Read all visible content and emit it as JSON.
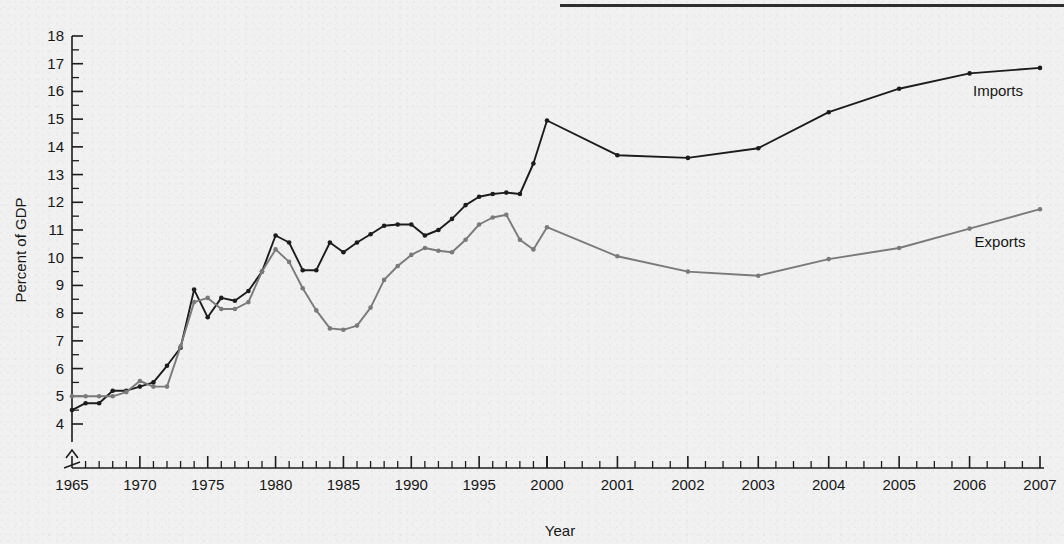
{
  "figure": {
    "background_color": "#f1f1f1",
    "rule_color": "#2e2e2e"
  },
  "axes": {
    "xlabel": "Year",
    "ylabel": "Percent of GDP",
    "y_tick_labels": [
      "4",
      "5",
      "6",
      "7",
      "8",
      "9",
      "10",
      "11",
      "12",
      "13",
      "14",
      "15",
      "16",
      "17",
      "18"
    ],
    "x_tick_labels": [
      "1965",
      "1970",
      "1975",
      "1980",
      "1985",
      "1990",
      "1995",
      "2000",
      "2001",
      "2002",
      "2003",
      "2004",
      "2005",
      "2006",
      "2007"
    ],
    "axis_break": "y-axis break below 4"
  },
  "legend": {
    "imports_label": "Imports",
    "exports_label": "Exports"
  },
  "chart_data": {
    "type": "line",
    "title": "",
    "xlabel": "Year",
    "ylabel": "Percent of GDP",
    "ylim": [
      4,
      18
    ],
    "xlim": [
      1965,
      2007
    ],
    "grid": false,
    "legend_position": "right-inline",
    "y_major_ticks": [
      4,
      5,
      6,
      7,
      8,
      9,
      10,
      11,
      12,
      13,
      14,
      15,
      16,
      17,
      18
    ],
    "x_major_ticks": [
      1965,
      1970,
      1975,
      1980,
      1985,
      1990,
      1995,
      2000,
      2001,
      2002,
      2003,
      2004,
      2005,
      2006,
      2007
    ],
    "x": [
      1965,
      1966,
      1967,
      1968,
      1969,
      1970,
      1971,
      1972,
      1973,
      1974,
      1975,
      1976,
      1977,
      1978,
      1979,
      1980,
      1981,
      1982,
      1983,
      1984,
      1985,
      1986,
      1987,
      1988,
      1989,
      1990,
      1991,
      1992,
      1993,
      1994,
      1995,
      1996,
      1997,
      1998,
      1999,
      2000,
      2001,
      2002,
      2003,
      2004,
      2005,
      2006,
      2007
    ],
    "series": [
      {
        "name": "Imports",
        "color": "#1c1c1c",
        "marker": "circle",
        "values": [
          4.5,
          4.75,
          4.75,
          5.2,
          5.2,
          5.35,
          5.5,
          6.1,
          6.75,
          8.85,
          7.85,
          8.55,
          8.45,
          8.8,
          9.5,
          10.8,
          10.55,
          9.55,
          9.55,
          10.55,
          10.2,
          10.55,
          10.85,
          11.15,
          11.2,
          11.2,
          10.8,
          11.0,
          11.4,
          11.9,
          12.2,
          12.3,
          12.35,
          12.3,
          13.4,
          14.95,
          13.7,
          13.6,
          13.95,
          15.25,
          16.1,
          16.65,
          16.85
        ]
      },
      {
        "name": "Exports",
        "color": "#7a7a7a",
        "marker": "circle",
        "values": [
          5.0,
          5.0,
          5.0,
          5.0,
          5.15,
          5.55,
          5.35,
          5.35,
          6.8,
          8.4,
          8.55,
          8.15,
          8.15,
          8.4,
          9.5,
          10.3,
          9.85,
          8.9,
          8.1,
          7.45,
          7.4,
          7.55,
          8.2,
          9.2,
          9.7,
          10.1,
          10.35,
          10.25,
          10.2,
          10.65,
          11.2,
          11.45,
          11.55,
          10.65,
          10.3,
          11.1,
          10.05,
          9.5,
          9.35,
          9.95,
          10.35,
          11.05,
          11.75
        ]
      }
    ]
  }
}
